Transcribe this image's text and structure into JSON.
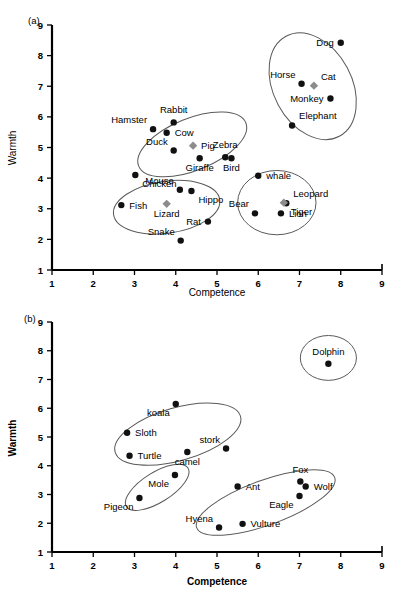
{
  "figure": {
    "panels": [
      {
        "tag": "(a)",
        "xlabel": "Competence",
        "ylabel": "Warmth"
      },
      {
        "tag": "(b)",
        "xlabel": "Competence",
        "ylabel": "Warmth"
      }
    ]
  },
  "chart_data": [
    {
      "type": "scatter",
      "panel": "(a)",
      "title": "",
      "xlabel": "Competence",
      "ylabel": "Warmth",
      "xlim": [
        1,
        9
      ],
      "ylim": [
        1,
        9
      ],
      "xticks": [
        1,
        2,
        3,
        4,
        5,
        6,
        7,
        8,
        9
      ],
      "yticks": [
        1,
        2,
        3,
        4,
        5,
        6,
        7,
        8,
        9
      ],
      "grid": false,
      "legend": "none",
      "points": [
        {
          "label": "Dog",
          "x": 8.0,
          "y": 8.42,
          "marker": "circle",
          "label_pos": "left"
        },
        {
          "label": "Cat",
          "x": 7.35,
          "y": 7.02,
          "marker": "diamond",
          "label_pos": "above-right"
        },
        {
          "label": "Horse",
          "x": 7.05,
          "y": 7.08,
          "marker": "circle",
          "label_pos": "above-left"
        },
        {
          "label": "Monkey",
          "x": 7.75,
          "y": 6.6,
          "marker": "circle",
          "label_pos": "left"
        },
        {
          "label": "Elephant",
          "x": 6.82,
          "y": 5.72,
          "marker": "circle",
          "label_pos": "above-right"
        },
        {
          "label": "Hamster",
          "x": 3.45,
          "y": 5.6,
          "marker": "circle",
          "label_pos": "above-left"
        },
        {
          "label": "Rabbit",
          "x": 3.95,
          "y": 5.82,
          "marker": "circle",
          "label_pos": "above"
        },
        {
          "label": "Cow",
          "x": 3.78,
          "y": 5.48,
          "marker": "circle",
          "label_pos": "right"
        },
        {
          "label": "Duck",
          "x": 3.95,
          "y": 4.9,
          "marker": "circle",
          "label_pos": "above-left"
        },
        {
          "label": "Pig",
          "x": 4.42,
          "y": 5.06,
          "marker": "diamond",
          "label_pos": "right"
        },
        {
          "label": "Zebra",
          "x": 5.2,
          "y": 4.68,
          "marker": "circle",
          "label_pos": "above"
        },
        {
          "label": "Giraffe",
          "x": 4.58,
          "y": 4.65,
          "marker": "circle",
          "label_pos": "below"
        },
        {
          "label": "Bird",
          "x": 5.35,
          "y": 4.65,
          "marker": "circle",
          "label_pos": "below"
        },
        {
          "label": "whale",
          "x": 6.0,
          "y": 4.08,
          "marker": "circle",
          "label_pos": "right"
        },
        {
          "label": "Chicken",
          "x": 3.02,
          "y": 4.1,
          "marker": "circle",
          "label_pos": "below-right"
        },
        {
          "label": "Mouse",
          "x": 4.1,
          "y": 3.62,
          "marker": "circle",
          "label_pos": "above-left"
        },
        {
          "label": "Fish",
          "x": 2.68,
          "y": 3.12,
          "marker": "circle",
          "label_pos": "right"
        },
        {
          "label": "Hippo",
          "x": 4.38,
          "y": 3.58,
          "marker": "circle",
          "label_pos": "below-right"
        },
        {
          "label": "Lizard",
          "x": 3.78,
          "y": 3.16,
          "marker": "diamond",
          "label_pos": "below"
        },
        {
          "label": "Rat",
          "x": 4.78,
          "y": 2.58,
          "marker": "circle",
          "label_pos": "left"
        },
        {
          "label": "Snake",
          "x": 4.12,
          "y": 1.96,
          "marker": "circle",
          "label_pos": "above-left"
        },
        {
          "label": "Bear",
          "x": 5.92,
          "y": 2.85,
          "marker": "circle",
          "label_pos": "above-left"
        },
        {
          "label": "Leopard",
          "x": 6.68,
          "y": 3.18,
          "marker": "circle",
          "label_pos": "above-right"
        },
        {
          "label": "Lion",
          "x": 6.55,
          "y": 2.85,
          "marker": "circle",
          "label_pos": "right"
        },
        {
          "label": "Tiger",
          "x": 6.62,
          "y": 3.2,
          "marker": "diamond",
          "label_pos": "below-right"
        }
      ],
      "clusters": [
        {
          "name": "pets-cluster",
          "cx": 7.32,
          "cy": 7.0,
          "rx": 0.95,
          "ry": 1.85,
          "rot": -28
        },
        {
          "name": "farm-cluster",
          "cx": 4.4,
          "cy": 5.1,
          "rx": 1.4,
          "ry": 0.85,
          "rot": -22
        },
        {
          "name": "small-pets-cluster",
          "cx": 3.78,
          "cy": 3.05,
          "rx": 1.3,
          "ry": 0.85,
          "rot": -8
        },
        {
          "name": "wild-cluster",
          "cx": 6.45,
          "cy": 3.2,
          "rx": 0.95,
          "ry": 1.05,
          "rot": 0
        }
      ]
    },
    {
      "type": "scatter",
      "panel": "(b)",
      "title": "",
      "xlabel": "Competence",
      "ylabel": "Warmth",
      "xlim": [
        1,
        9
      ],
      "ylim": [
        1,
        9
      ],
      "xticks": [
        1,
        2,
        3,
        4,
        5,
        6,
        7,
        8,
        9
      ],
      "yticks": [
        1,
        2,
        3,
        4,
        5,
        6,
        7,
        8,
        9
      ],
      "grid": false,
      "legend": "none",
      "points": [
        {
          "label": "Dolphin",
          "x": 7.7,
          "y": 7.55,
          "marker": "circle",
          "label_pos": "above"
        },
        {
          "label": "koala",
          "x": 4.0,
          "y": 6.15,
          "marker": "circle",
          "label_pos": "below-left"
        },
        {
          "label": "Sloth",
          "x": 2.82,
          "y": 5.15,
          "marker": "circle",
          "label_pos": "right"
        },
        {
          "label": "stork",
          "x": 5.22,
          "y": 4.6,
          "marker": "circle",
          "label_pos": "above-left"
        },
        {
          "label": "Turtle",
          "x": 2.88,
          "y": 4.35,
          "marker": "circle",
          "label_pos": "right"
        },
        {
          "label": "camel",
          "x": 4.28,
          "y": 4.48,
          "marker": "circle",
          "label_pos": "below"
        },
        {
          "label": "Mole",
          "x": 3.98,
          "y": 3.68,
          "marker": "circle",
          "label_pos": "below-left"
        },
        {
          "label": "Pigeon",
          "x": 3.12,
          "y": 2.88,
          "marker": "circle",
          "label_pos": "below-left"
        },
        {
          "label": "Ant",
          "x": 5.5,
          "y": 3.28,
          "marker": "circle",
          "label_pos": "right"
        },
        {
          "label": "Fox",
          "x": 7.02,
          "y": 3.45,
          "marker": "circle",
          "label_pos": "above"
        },
        {
          "label": "Wolf",
          "x": 7.15,
          "y": 3.28,
          "marker": "circle",
          "label_pos": "right"
        },
        {
          "label": "Eagle",
          "x": 7.0,
          "y": 2.95,
          "marker": "circle",
          "label_pos": "below-left"
        },
        {
          "label": "Hyena",
          "x": 5.05,
          "y": 1.85,
          "marker": "circle",
          "label_pos": "above-left"
        },
        {
          "label": "Vulture",
          "x": 5.62,
          "y": 1.98,
          "marker": "circle",
          "label_pos": "right"
        }
      ],
      "clusters": [
        {
          "name": "dolphin-cluster",
          "cx": 7.7,
          "cy": 7.75,
          "rx": 0.68,
          "ry": 0.78,
          "rot": 0
        },
        {
          "name": "gentle-cluster",
          "cx": 4.05,
          "cy": 5.1,
          "rx": 1.58,
          "ry": 0.92,
          "rot": -16
        },
        {
          "name": "mole-cluster",
          "cx": 3.55,
          "cy": 3.25,
          "rx": 0.88,
          "ry": 0.52,
          "rot": -32
        },
        {
          "name": "predator-cluster",
          "cx": 6.18,
          "cy": 2.72,
          "rx": 1.78,
          "ry": 0.78,
          "rot": -20
        }
      ]
    }
  ],
  "colors": {
    "marker_circle": "#111111",
    "marker_diamond": "#8c8c8c",
    "cluster_outline": "#5a5a5a",
    "axis": "#000000",
    "text": "#000000"
  }
}
